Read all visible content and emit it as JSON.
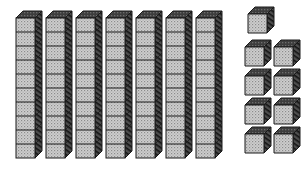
{
  "illustration": {
    "title": "Base Ten Blocks",
    "subject": "place-value-manipulatives",
    "style": "isometric-line-drawing",
    "background_color": "#ffffff"
  },
  "colors": {
    "outline": "#1a1a1a",
    "front_face": "#c9c9c9",
    "front_face_speckle": "#8f8f8f",
    "side_face": "#4a4a4a",
    "side_face_hatch": "#111111",
    "top_face": "#3a3a3a",
    "top_face_highlight": "#6e6e6e",
    "background": "#ffffff"
  },
  "geometry": {
    "canvas_width": 302,
    "canvas_height": 171,
    "cube_face_size": 19,
    "depth_x": 7,
    "depth_y": 7
  },
  "tens_group": {
    "name": "tens-rods-group",
    "label": "Tens rods",
    "rod_count": 7,
    "units_per_rod": 10,
    "total_units": 70,
    "first_rod_x": 16,
    "rod_spacing_x": 30,
    "rod_top_y": 18,
    "rod_unit_height": 14,
    "rods": [
      {
        "index": 1,
        "x": 16,
        "y": 18,
        "segments": 10
      },
      {
        "index": 2,
        "x": 46,
        "y": 18,
        "segments": 10
      },
      {
        "index": 3,
        "x": 76,
        "y": 18,
        "segments": 10
      },
      {
        "index": 4,
        "x": 106,
        "y": 18,
        "segments": 10
      },
      {
        "index": 5,
        "x": 136,
        "y": 18,
        "segments": 10
      },
      {
        "index": 6,
        "x": 166,
        "y": 18,
        "segments": 10
      },
      {
        "index": 7,
        "x": 196,
        "y": 18,
        "segments": 10
      }
    ]
  },
  "ones_group": {
    "name": "unit-cubes-group",
    "label": "Unit cubes",
    "cube_count": 9,
    "rows": [
      {
        "row": 1,
        "count": 1,
        "cubes": [
          {
            "x": 248,
            "y": 14
          }
        ]
      },
      {
        "row": 2,
        "count": 2,
        "cubes": [
          {
            "x": 245,
            "y": 47
          },
          {
            "x": 274,
            "y": 47
          }
        ]
      },
      {
        "row": 3,
        "count": 2,
        "cubes": [
          {
            "x": 245,
            "y": 76
          },
          {
            "x": 274,
            "y": 76
          }
        ]
      },
      {
        "row": 4,
        "count": 2,
        "cubes": [
          {
            "x": 245,
            "y": 105
          },
          {
            "x": 274,
            "y": 105
          }
        ]
      },
      {
        "row": 5,
        "count": 2,
        "cubes": [
          {
            "x": 245,
            "y": 134
          },
          {
            "x": 274,
            "y": 134
          }
        ]
      }
    ]
  },
  "chart_data": {
    "type": "bar",
    "categories": [
      "Tens",
      "Ones"
    ],
    "values": [
      7,
      9
    ],
    "unit_values": [
      70,
      9
    ],
    "represented_number": 79,
    "xlabel": "Place value",
    "ylabel": "Count of blocks",
    "ylim": [
      0,
      10
    ],
    "grid": false,
    "legend": "none",
    "annotations": [
      "7 rods of ten = 70",
      "9 unit cubes = 9",
      "Total = 79"
    ]
  }
}
